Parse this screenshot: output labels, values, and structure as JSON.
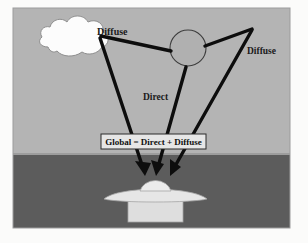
{
  "figure": {
    "name": "global-irradiance-diagram",
    "width": 308,
    "height": 243,
    "frame": {
      "x": 13,
      "y": 8,
      "width": 277,
      "height": 220
    }
  },
  "colors": {
    "page_background": "#fbfbfa",
    "sky": "#b4b4b4",
    "ground": "#5c5c5c",
    "cloud_fill": "#fcfcfc",
    "cloud_outline": "#8e8e8e",
    "sun_fill": "#b0b0b0",
    "sun_outline": "#3d3d3d",
    "ray": "#0d0d0d",
    "object_light": "#e2e2e2",
    "object_mid": "#d4d4d4",
    "object_outline": "#9a9a9a",
    "box_fill": "#e6e6e6",
    "box_border": "#2a2a2a",
    "text": "#1a1a1a",
    "frame_border": "#9c9c9c"
  },
  "scene": {
    "sky_label": "sky-region",
    "ground_label": "ground-region",
    "horizon_y": 155
  },
  "sources": {
    "cloud": {
      "name": "cloud",
      "cx": 72,
      "cy": 38,
      "role": "diffuse-source"
    },
    "sun": {
      "name": "sun",
      "cx": 188,
      "cy": 48,
      "r": 18,
      "role": "direct-source"
    }
  },
  "target": {
    "name": "measurement-object",
    "dome_cx": 155,
    "dome_cy": 186,
    "brim_y": 194,
    "base_label": "pedestal"
  },
  "labels": {
    "diffuse_left": "Diffuse",
    "direct": "Direct",
    "diffuse_right": "Diffuse",
    "equation": "Global = Direct + Diffuse"
  },
  "label_positions": {
    "diffuse_left": {
      "x": 97,
      "y": 35
    },
    "direct": {
      "x": 143,
      "y": 100
    },
    "diffuse_right": {
      "x": 247,
      "y": 54
    },
    "equation_box": {
      "x": 101,
      "y": 134,
      "width": 105,
      "height": 15
    }
  },
  "rays": [
    {
      "name": "ray-cloud-to-sun",
      "kind": "diffuse",
      "from": "cloud",
      "to": "sun",
      "arrow": false
    },
    {
      "name": "ray-cloud-to-target",
      "kind": "diffuse",
      "from": "cloud",
      "to": "target",
      "arrow": true
    },
    {
      "name": "ray-sun-to-target",
      "kind": "direct",
      "from": "sun",
      "to": "target",
      "arrow": true
    },
    {
      "name": "ray-sun-to-apex",
      "kind": "diffuse",
      "from": "sun",
      "to": "right-apex",
      "arrow": false
    },
    {
      "name": "ray-apex-to-target",
      "kind": "diffuse",
      "from": "right-apex",
      "to": "target",
      "arrow": true
    }
  ]
}
